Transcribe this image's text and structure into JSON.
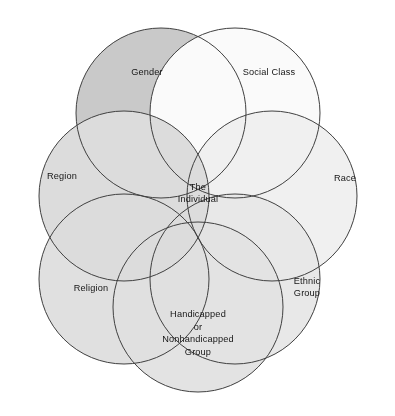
{
  "figure": {
    "type": "venn-diagram",
    "shape": "six overlapping circles in a hexagonal ring around a central region",
    "background_color": "#ffffff",
    "outline_color": "#404040",
    "top_rule_color": "#a9a9a9"
  },
  "center": {
    "name": "center-region",
    "line1": "The",
    "line2": "Individual",
    "fill": "#f4f4f4",
    "x": 198,
    "y": 196
  },
  "circles": [
    {
      "id": "gender",
      "label": "Gender",
      "lines": [
        "Gender"
      ],
      "fill": "#c9c9c9",
      "cx": 161,
      "cy": 113,
      "r": 85,
      "label_x": 147,
      "label_y": 73
    },
    {
      "id": "social-class",
      "label": "Social Class",
      "lines": [
        "Social Class"
      ],
      "fill": "#fafafa",
      "cx": 235,
      "cy": 113,
      "r": 85,
      "label_x": 269,
      "label_y": 73
    },
    {
      "id": "race",
      "label": "Race",
      "lines": [
        "Race"
      ],
      "fill": "#f0f0f0",
      "cx": 272,
      "cy": 196,
      "r": 85,
      "label_x": 345,
      "label_y": 179
    },
    {
      "id": "ethnic-group",
      "label": "Ethnic Group",
      "lines": [
        "Ethnic",
        "Group"
      ],
      "fill": "#e8e8e8",
      "cx": 235,
      "cy": 279,
      "r": 85,
      "label_x": 307,
      "label_y": 288
    },
    {
      "id": "handicapped-group",
      "label": "Handicapped or Nonhandicapped Group",
      "lines": [
        "Handicapped",
        "or",
        "Nonhandicapped",
        "Group"
      ],
      "fill": "#e3e3e3",
      "cx": 198,
      "cy": 307,
      "r": 85,
      "label_x": 198,
      "label_y": 334
    },
    {
      "id": "religion",
      "label": "Religion",
      "lines": [
        "Religion"
      ],
      "fill": "#e0e0e0",
      "cx": 124,
      "cy": 279,
      "r": 85,
      "label_x": 91,
      "label_y": 289
    },
    {
      "id": "region",
      "label": "Region",
      "lines": [
        "Region"
      ],
      "fill": "#dcdcdc",
      "cx": 124,
      "cy": 196,
      "r": 85,
      "label_x": 62,
      "label_y": 177
    }
  ]
}
